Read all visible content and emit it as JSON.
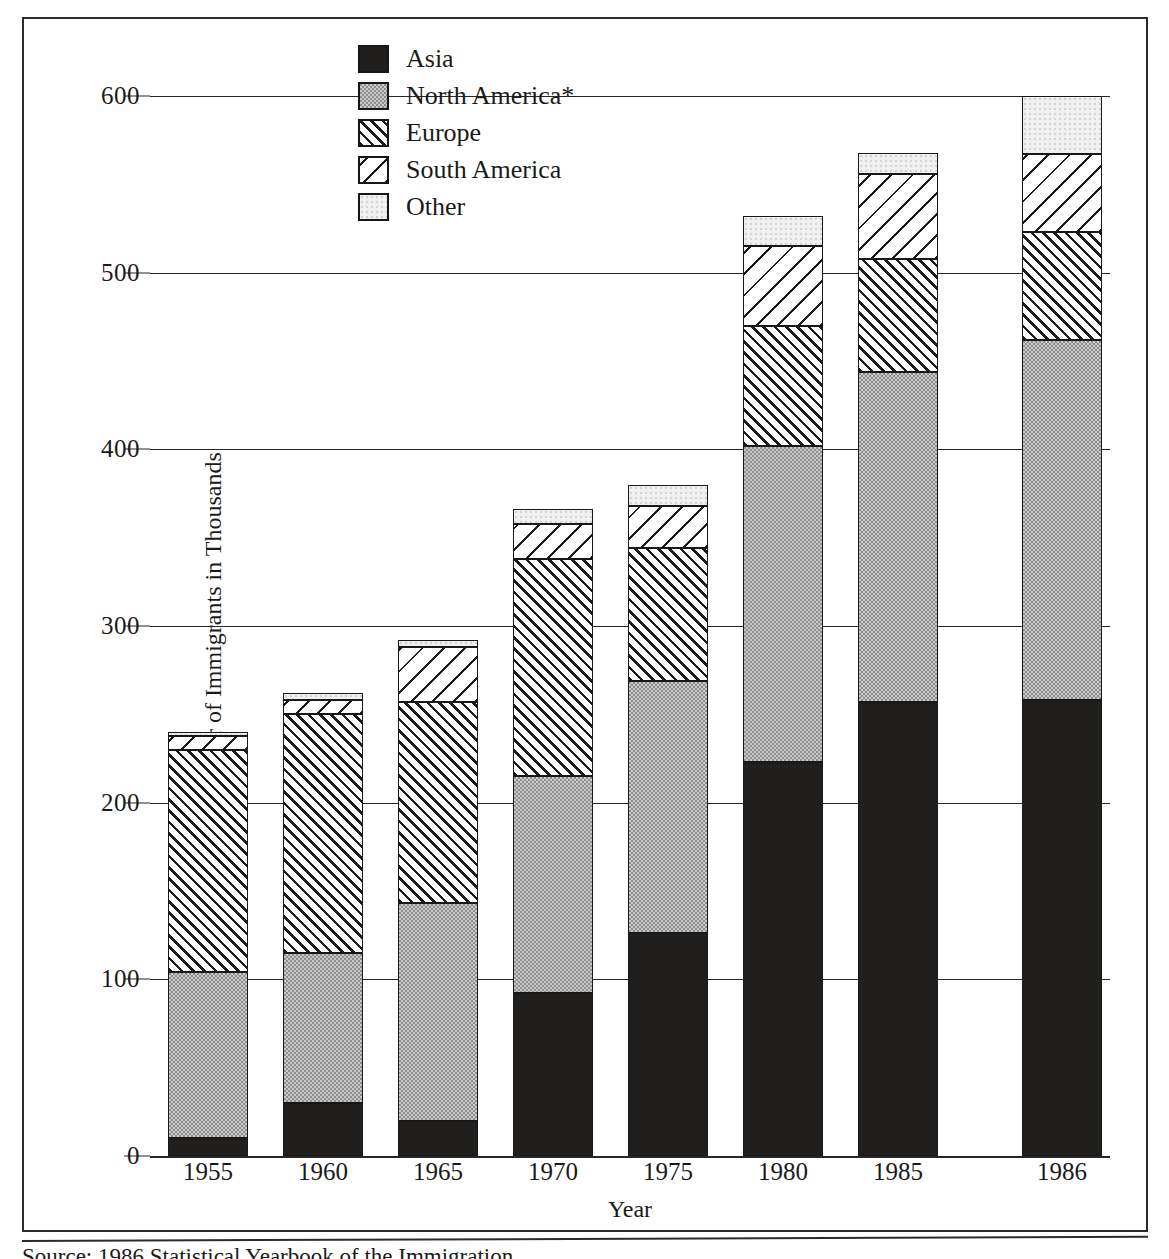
{
  "figure": {
    "y_axis_label": "Number of Immigrants in Thousands",
    "x_axis_label": "Year",
    "source_note": "Source: 1986 Statistical Yearbook of the Immigration"
  },
  "legend": {
    "items": [
      {
        "label": "Asia",
        "pattern": "solid-black",
        "color": "#201f1e"
      },
      {
        "label": "North America*",
        "pattern": "gray-stipple",
        "color": "#c9c9c9"
      },
      {
        "label": "Europe",
        "pattern": "dense-forward-hatch",
        "color": "#ffffff"
      },
      {
        "label": "South America",
        "pattern": "sparse-back-hatch",
        "color": "#ffffff"
      },
      {
        "label": "Other",
        "pattern": "light-stipple",
        "color": "#f0f0f0"
      }
    ]
  },
  "chart_data": {
    "type": "bar",
    "stacked": true,
    "title": "",
    "xlabel": "Year",
    "ylabel": "Number of Immigrants in Thousands",
    "ylim": [
      0,
      600
    ],
    "yticks": [
      0,
      100,
      200,
      300,
      400,
      500,
      600
    ],
    "grid": true,
    "legend_position": "top-left-inside",
    "categories": [
      "1955",
      "1960",
      "1965",
      "1970",
      "1975",
      "1980",
      "1985",
      "1986"
    ],
    "series": [
      {
        "name": "Asia",
        "values": [
          10,
          30,
          20,
          92,
          126,
          223,
          257,
          258
        ]
      },
      {
        "name": "North America*",
        "values": [
          94,
          85,
          123,
          123,
          143,
          179,
          187,
          204
        ]
      },
      {
        "name": "Europe",
        "values": [
          126,
          135,
          114,
          123,
          75,
          68,
          64,
          61
        ]
      },
      {
        "name": "South America",
        "values": [
          8,
          8,
          31,
          20,
          24,
          45,
          48,
          44
        ]
      },
      {
        "name": "Other",
        "values": [
          2,
          4,
          4,
          8,
          12,
          17,
          12,
          33
        ]
      }
    ],
    "totals": [
      240,
      262,
      292,
      366,
      380,
      532,
      568,
      600
    ]
  }
}
